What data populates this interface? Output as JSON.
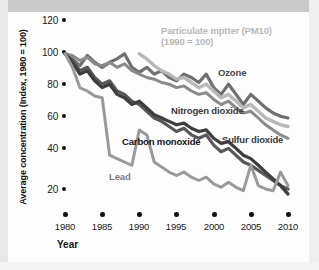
{
  "chart_data": {
    "type": "line",
    "title": "",
    "xlabel": "Year",
    "ylabel": "Average concentration (Index, 1980 = 100)",
    "xlim": [
      1980,
      2010
    ],
    "ylim": [
      10,
      125
    ],
    "grid": false,
    "legend_position": "inline-annotations",
    "xticks": [
      "1980",
      "1985",
      "1990",
      "1995",
      "2000",
      "2005",
      "2010"
    ],
    "yticks": [
      "120",
      "100",
      "80",
      "60",
      "40",
      "20"
    ],
    "x": [
      1980,
      1981,
      1982,
      1983,
      1984,
      1985,
      1986,
      1987,
      1988,
      1989,
      1990,
      1991,
      1992,
      1993,
      1994,
      1995,
      1996,
      1997,
      1998,
      1999,
      2000,
      2001,
      2002,
      2003,
      2004,
      2005,
      2006,
      2007,
      2008,
      2009,
      2010
    ],
    "series": [
      {
        "name": "Ozone",
        "color": "#6f6f6f",
        "label": "Ozone",
        "note": "",
        "values": [
          100,
          97,
          93,
          99,
          95,
          92,
          95,
          97,
          100,
          92,
          89,
          92,
          88,
          90,
          86,
          84,
          88,
          86,
          83,
          88,
          80,
          76,
          82,
          76,
          70,
          76,
          72,
          68,
          65,
          63,
          62
        ]
      },
      {
        "name": "Particulate matter (PM10)",
        "color": "#b8b8b8",
        "label": "Particulate mptter (PM10)",
        "note": "(1990 = 100)",
        "values": [
          null,
          null,
          null,
          null,
          null,
          null,
          null,
          null,
          null,
          null,
          100,
          97,
          93,
          90,
          88,
          85,
          86,
          83,
          80,
          82,
          78,
          74,
          76,
          72,
          68,
          70,
          66,
          62,
          60,
          58,
          57
        ]
      },
      {
        "name": "Nitrogen dioxide",
        "color": "#8a8a8a",
        "label": "Nitrogen dioxide",
        "note": "",
        "values": [
          100,
          99,
          96,
          98,
          94,
          93,
          95,
          92,
          94,
          90,
          88,
          86,
          85,
          83,
          82,
          80,
          81,
          78,
          76,
          77,
          73,
          70,
          72,
          68,
          65,
          66,
          62,
          58,
          55,
          52,
          50
        ]
      },
      {
        "name": "Carbon monoxide",
        "color": "#585858",
        "label": "Carbon monoxide",
        "note": "",
        "values": [
          100,
          96,
          90,
          92,
          86,
          82,
          84,
          78,
          76,
          72,
          70,
          66,
          62,
          60,
          57,
          54,
          56,
          52,
          50,
          52,
          46,
          42,
          44,
          40,
          36,
          34,
          31,
          28,
          25,
          22,
          20
        ]
      },
      {
        "name": "Sulfur dioxide",
        "color": "#3d3d3d",
        "label": "Sulfur dioxide",
        "note": "",
        "values": [
          100,
          95,
          88,
          90,
          84,
          80,
          82,
          76,
          74,
          70,
          72,
          68,
          64,
          62,
          60,
          58,
          59,
          56,
          54,
          55,
          50,
          47,
          48,
          44,
          40,
          38,
          34,
          30,
          26,
          22,
          17
        ]
      },
      {
        "name": "Lead",
        "color": "#9a9a9a",
        "label": "Lead",
        "note": "",
        "values": [
          100,
          92,
          80,
          78,
          75,
          74,
          40,
          38,
          36,
          34,
          55,
          52,
          36,
          33,
          30,
          28,
          30,
          27,
          25,
          27,
          23,
          21,
          24,
          21,
          19,
          34,
          22,
          20,
          19,
          30,
          22
        ]
      }
    ]
  }
}
